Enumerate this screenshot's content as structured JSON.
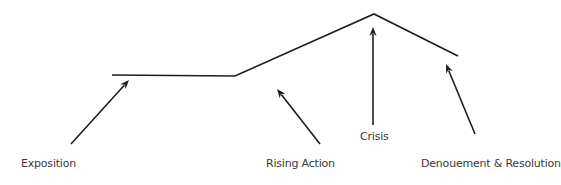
{
  "diagram": {
    "colors": {
      "line": "#1e1e1e",
      "text": "#3a3a3a",
      "background": "#ffffff"
    },
    "plot_line_points": [
      [
        112,
        75
      ],
      [
        235,
        76
      ],
      [
        374,
        14
      ],
      [
        458,
        56
      ]
    ],
    "labels": [
      {
        "id": "exposition",
        "text": "Exposition",
        "x": 21,
        "y": 158
      },
      {
        "id": "rising-action",
        "text": "Rising Action",
        "x": 266,
        "y": 158
      },
      {
        "id": "crisis",
        "text": "Crisis",
        "x": 360,
        "y": 131
      },
      {
        "id": "denouement-resolution",
        "text": "Denouement & Resolution",
        "x": 421,
        "y": 158
      }
    ],
    "arrows": [
      {
        "id": "exposition-arrow",
        "from": [
          71,
          144
        ],
        "to": [
          129,
          80
        ]
      },
      {
        "id": "rising-action-arrow",
        "from": [
          320,
          144
        ],
        "to": [
          277,
          89
        ]
      },
      {
        "id": "crisis-arrow",
        "from": [
          373,
          125
        ],
        "to": [
          373,
          27
        ]
      },
      {
        "id": "denouement-arrow",
        "from": [
          475,
          134
        ],
        "to": [
          446,
          64
        ]
      }
    ]
  }
}
